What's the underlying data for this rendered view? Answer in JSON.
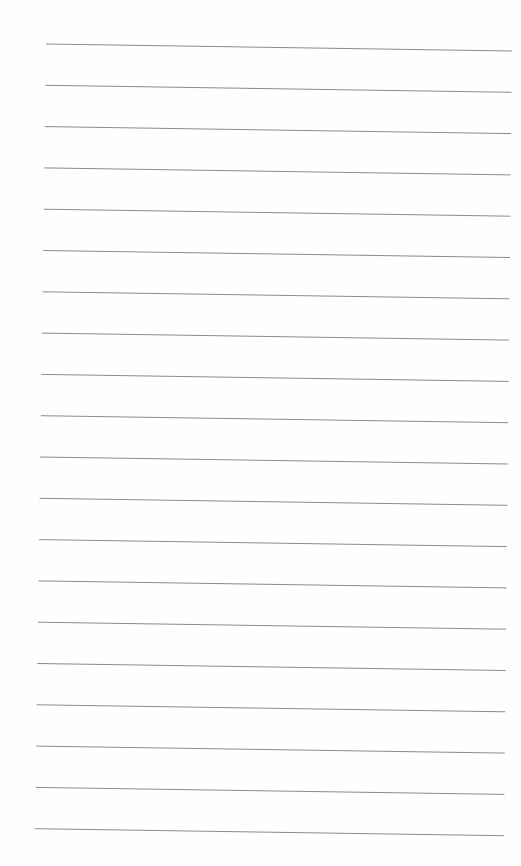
{
  "document": {
    "type": "lined-paper",
    "line_count": 20,
    "line_color": "#8a8a8a",
    "background_color": "#fefefe",
    "text": ""
  }
}
